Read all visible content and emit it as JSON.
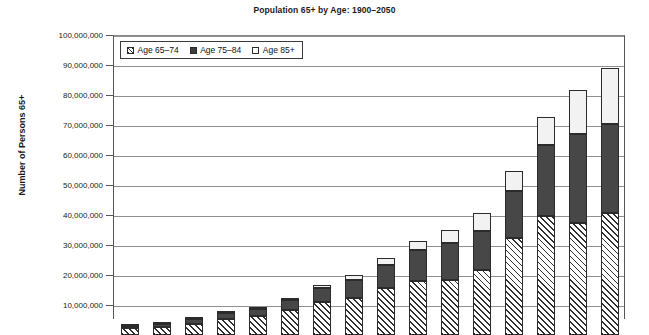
{
  "chart_data": {
    "type": "bar",
    "title": "Population 65+ by Age: 1900–2050",
    "xlabel": "",
    "ylabel": "Number of Persons 65+",
    "ylim": [
      0,
      100000000
    ],
    "grid": true,
    "stacked": true,
    "legend_position": "top-left-inside",
    "ytick_labels": [
      "100,000,000",
      "90,000,000",
      "80,000,000",
      "70,000,000",
      "60,000,000",
      "50,000,000",
      "40,000,000",
      "30,000,000",
      "20,000,000",
      "10,000,000"
    ],
    "ytick_values": [
      100000000,
      90000000,
      80000000,
      70000000,
      60000000,
      50000000,
      40000000,
      30000000,
      20000000,
      10000000
    ],
    "categories": [
      "1900",
      "1910",
      "1920",
      "1930",
      "1940",
      "1950",
      "1960",
      "1970",
      "1980",
      "1990",
      "2000",
      "2010",
      "2020",
      "2030",
      "2040",
      "2050"
    ],
    "series": [
      {
        "name": "Age 65–74",
        "values": [
          2200000,
          2800000,
          3800000,
          5400000,
          6400000,
          8400000,
          11000000,
          12400000,
          15600000,
          18100000,
          18400000,
          21700000,
          32300000,
          39600000,
          37300000,
          40800000
        ]
      },
      {
        "name": "Age 75–84",
        "values": [
          770000,
          990000,
          1400000,
          1900000,
          2300000,
          3300000,
          4600000,
          6100000,
          7700000,
          10100000,
          12400000,
          13100000,
          15800000,
          23900000,
          29800000,
          29400000
        ]
      },
      {
        "name": "Age 85+",
        "values": [
          120000,
          170000,
          210000,
          270000,
          370000,
          590000,
          940000,
          1500000,
          2300000,
          3100000,
          4300000,
          5800000,
          6600000,
          9100000,
          14600000,
          18900000
        ]
      }
    ],
    "totals": [
      3090000,
      3960000,
      5410000,
      7570000,
      9070000,
      12290000,
      16540000,
      20000000,
      25600000,
      31300000,
      35100000,
      40600000,
      54700000,
      72600000,
      81700000,
      89100000
    ],
    "colors": {
      "age_65_74": "#ffffff",
      "age_65_74_hatch": "#2f2f2f",
      "age_75_84": "#474747",
      "age_85_plus": "#f2f2f2",
      "grid": "#8f8f8f",
      "axis": "#555555",
      "text": "#1a1a1a"
    }
  },
  "legend": {
    "items": [
      {
        "label": "Age 65–74",
        "swatch": "hatched-swatch"
      },
      {
        "label": "Age 75–84",
        "swatch": "solid-dark-swatch"
      },
      {
        "label": "Age 85+",
        "swatch": "outline-swatch"
      }
    ]
  }
}
